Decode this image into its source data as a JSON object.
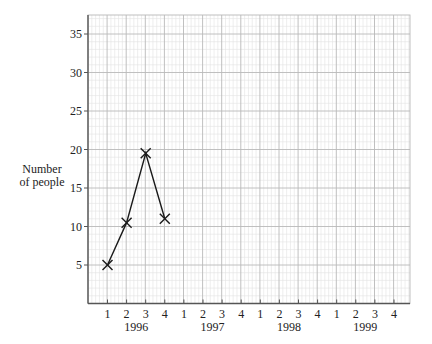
{
  "chart_data": {
    "type": "line",
    "title": "",
    "ylabel": "Number of people",
    "xlabel": "",
    "ylim": [
      0,
      37.8
    ],
    "yticks": [
      5,
      10,
      15,
      20,
      25,
      30,
      35
    ],
    "x_quarter_labels": [
      "1",
      "2",
      "3",
      "4",
      "1",
      "2",
      "3",
      "4",
      "1",
      "2",
      "3",
      "4",
      "1",
      "2",
      "3",
      "4"
    ],
    "x_year_labels": [
      "1996",
      "1997",
      "1998",
      "1999"
    ],
    "grid": true,
    "marker": "x",
    "series": [
      {
        "name": "Number of people",
        "points": [
          {
            "year": "1996",
            "quarter": 1,
            "value": 5
          },
          {
            "year": "1996",
            "quarter": 2,
            "value": 10.5
          },
          {
            "year": "1996",
            "quarter": 3,
            "value": 19.5
          },
          {
            "year": "1996",
            "quarter": 4,
            "value": 11
          }
        ]
      }
    ]
  },
  "labels": {
    "ylabel_line1": "Number",
    "ylabel_line2": "of people"
  },
  "colors": {
    "minor_grid": "#e3e3e3",
    "major_grid": "#b9b9b9",
    "axis": "#555555",
    "line": "#1a1a1a"
  }
}
